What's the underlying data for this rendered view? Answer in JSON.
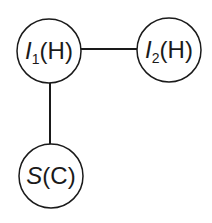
{
  "diagram": {
    "type": "graph",
    "nodes": [
      {
        "id": "I1",
        "main": "I",
        "sub": "1",
        "suffix": "(H)",
        "label": "I1(H)",
        "cx": 49,
        "cy": 51
      },
      {
        "id": "I2",
        "main": "I",
        "sub": "2",
        "suffix": "(H)",
        "label": "I2(H)",
        "cx": 169,
        "cy": 50
      },
      {
        "id": "S",
        "main": "S",
        "sub": "",
        "suffix": "(C)",
        "label": "S(C)",
        "cx": 51,
        "cy": 176
      }
    ],
    "edges": [
      {
        "from": "I1",
        "to": "I2"
      },
      {
        "from": "I1",
        "to": "S"
      }
    ]
  }
}
